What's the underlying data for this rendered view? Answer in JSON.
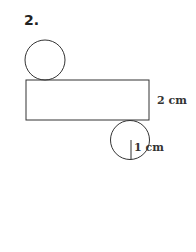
{
  "problem_number": "2.",
  "figure": {
    "height_label": "2 cm",
    "radius_label": "1 cm"
  },
  "colors": {
    "stroke": "#333333",
    "text": "#222222",
    "background": "#ffffff"
  }
}
